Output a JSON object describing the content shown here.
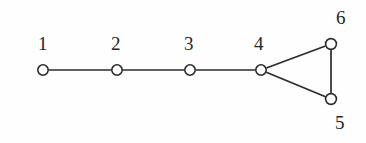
{
  "figure": {
    "name": "graph-diagram",
    "background_color": "#fefefe",
    "stroke_color": "#2b2b2b",
    "label_color": "#262626"
  },
  "graph": {
    "type": "undirected-graph",
    "nodes": [
      {
        "id": "1",
        "label": "1",
        "cx": 43,
        "cy": 70,
        "r": 5.2,
        "label_x": 38,
        "label_y": 34
      },
      {
        "id": "2",
        "label": "2",
        "cx": 117,
        "cy": 70,
        "r": 5.2,
        "label_x": 111,
        "label_y": 34
      },
      {
        "id": "3",
        "label": "3",
        "cx": 190,
        "cy": 70,
        "r": 5.2,
        "label_x": 184,
        "label_y": 34
      },
      {
        "id": "4",
        "label": "4",
        "cx": 261,
        "cy": 70,
        "r": 5.2,
        "label_x": 254,
        "label_y": 34
      },
      {
        "id": "5",
        "label": "5",
        "cx": 331,
        "cy": 99,
        "r": 5.4,
        "label_x": 335,
        "label_y": 113
      },
      {
        "id": "6",
        "label": "6",
        "cx": 331,
        "cy": 44,
        "r": 5.4,
        "label_x": 336,
        "label_y": 8
      }
    ],
    "edges": [
      {
        "from": "1",
        "to": "2",
        "name": "edge-1-2"
      },
      {
        "from": "2",
        "to": "3",
        "name": "edge-2-3"
      },
      {
        "from": "3",
        "to": "4",
        "name": "edge-3-4"
      },
      {
        "from": "4",
        "to": "6",
        "name": "edge-4-6"
      },
      {
        "from": "4",
        "to": "5",
        "name": "edge-4-5"
      },
      {
        "from": "6",
        "to": "5",
        "name": "edge-6-5"
      }
    ]
  }
}
